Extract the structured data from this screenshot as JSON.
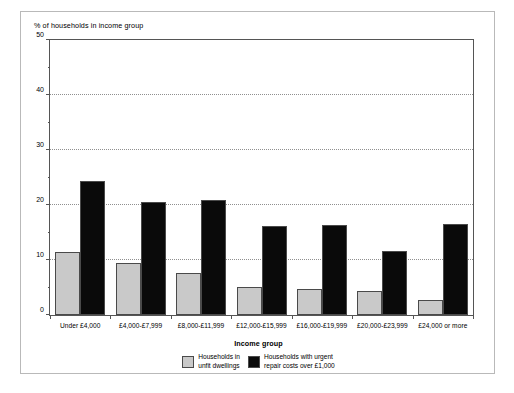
{
  "chart_data": {
    "type": "bar",
    "title": "",
    "xlabel": "Income group",
    "ylabel": "% of households in income group",
    "ylim": [
      0,
      50
    ],
    "yticks": [
      0,
      10,
      20,
      30,
      40,
      50
    ],
    "yticks_minor": [
      5,
      15,
      25,
      35,
      45
    ],
    "grid": "horizontal dotted gridlines at 10, 20, 30, 40",
    "legend_position": "bottom-center",
    "categories": [
      "Under £4,000",
      "£4,000-£7,999",
      "£8,000-£11,999",
      "£12,000-£15,999",
      "£16,000-£19,999",
      "£20,000-£23,999",
      "£24,000 or more"
    ],
    "series": [
      {
        "name": "Households in\nunfit dwellings",
        "color": "#c9c9c9",
        "values": [
          11.5,
          9.4,
          7.6,
          5.1,
          4.7,
          4.3,
          2.7
        ]
      },
      {
        "name": "Households with urgent\nrepair costs over £1,000",
        "color": "#0a0a0a",
        "values": [
          24.3,
          20.5,
          21.0,
          16.1,
          16.3,
          11.6,
          16.5
        ]
      }
    ]
  }
}
